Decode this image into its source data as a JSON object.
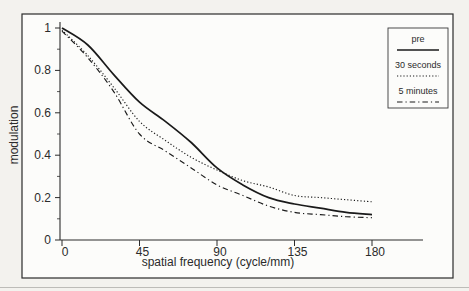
{
  "figure": {
    "outer_background": "#f3f2ee",
    "inner_background": "#fcfcfa",
    "frame_color": "#2b2b2b",
    "line_color": "#1a1a1a",
    "text_color": "#2b2b2b"
  },
  "chart_data": {
    "type": "line",
    "title": "",
    "xlabel": "spatial frequency (cycle/mm)",
    "ylabel": "modulation",
    "xlim": [
      0,
      180
    ],
    "ylim": [
      0,
      1
    ],
    "grid": false,
    "x_ticks": [
      0,
      45,
      90,
      135,
      180
    ],
    "x_tick_labels": [
      "0",
      "45",
      "90",
      "135",
      "180"
    ],
    "y_ticks": [
      0,
      0.2,
      0.4,
      0.6,
      0.8,
      1
    ],
    "y_tick_labels": [
      "0",
      "0.2",
      "0.4",
      "0.6",
      "0.8",
      "1"
    ],
    "y_minor_ticks": [
      0.1,
      0.3,
      0.5,
      0.7,
      0.9
    ],
    "legend_position": "top-right",
    "x": [
      0,
      15,
      30,
      45,
      60,
      75,
      90,
      105,
      120,
      135,
      150,
      165,
      180
    ],
    "series": [
      {
        "name": "pre",
        "style": "solid",
        "values": [
          1.0,
          0.92,
          0.78,
          0.65,
          0.56,
          0.46,
          0.34,
          0.26,
          0.2,
          0.17,
          0.15,
          0.13,
          0.12
        ]
      },
      {
        "name": "30 seconds",
        "style": "dotted",
        "values": [
          0.99,
          0.87,
          0.72,
          0.56,
          0.47,
          0.39,
          0.33,
          0.28,
          0.25,
          0.21,
          0.2,
          0.19,
          0.18
        ]
      },
      {
        "name": "5 minutes",
        "style": "dash-dot",
        "values": [
          0.985,
          0.86,
          0.7,
          0.5,
          0.42,
          0.34,
          0.26,
          0.21,
          0.16,
          0.13,
          0.12,
          0.11,
          0.105
        ]
      }
    ]
  }
}
